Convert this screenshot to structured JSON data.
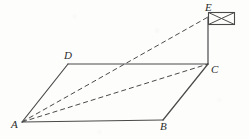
{
  "figure": {
    "background_color": "#fdfdfc",
    "stroke_color": "#4a4a4a",
    "label_color": "#2b2b2b",
    "canvas": {
      "width": 249,
      "height": 139
    }
  },
  "points": {
    "A": {
      "label": "A",
      "x": 22,
      "y": 122,
      "label_x": 11,
      "label_y": 119
    },
    "B": {
      "label": "B",
      "x": 163,
      "y": 120,
      "label_x": 160,
      "label_y": 121
    },
    "C": {
      "label": "C",
      "x": 208,
      "y": 64,
      "label_x": 211,
      "label_y": 64
    },
    "D": {
      "label": "D",
      "x": 68,
      "y": 64,
      "label_x": 64,
      "label_y": 50
    },
    "E": {
      "label": "E",
      "x": 208,
      "y": 17,
      "label_x": 205,
      "label_y": 2
    }
  },
  "segments": [
    {
      "name": "segment-AB",
      "from": "A",
      "to": "B",
      "style": "solid"
    },
    {
      "name": "segment-BC",
      "from": "B",
      "to": "C",
      "style": "solid"
    },
    {
      "name": "segment-CD",
      "from": "C",
      "to": "D",
      "style": "solid"
    },
    {
      "name": "segment-DA",
      "from": "D",
      "to": "A",
      "style": "solid"
    },
    {
      "name": "segment-CE",
      "from": "C",
      "to": "E",
      "style": "solid"
    },
    {
      "name": "segment-AC",
      "from": "A",
      "to": "C",
      "style": "dashed"
    },
    {
      "name": "segment-AE",
      "from": "A",
      "to": "E",
      "style": "dashed"
    }
  ],
  "flag": {
    "name": "flag",
    "description": "rectangular flag with crossed diagonals",
    "x": 208,
    "y": 12,
    "width": 26,
    "height": 12
  },
  "stroke_widths": {
    "solid": 1.2,
    "dashed": 1.0,
    "flag": 1.0
  },
  "dash_patterns": {
    "dashed": "5,3"
  }
}
